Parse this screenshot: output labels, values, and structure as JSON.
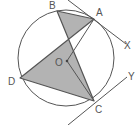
{
  "diagram": {
    "labels": {
      "A": "A",
      "B": "B",
      "C": "C",
      "D": "D",
      "O": "O",
      "X": "X",
      "Y": "Y"
    },
    "colors": {
      "stroke": "#555555",
      "fill": "#b3b3b3",
      "text": "#555555"
    }
  }
}
